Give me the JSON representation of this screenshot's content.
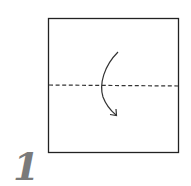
{
  "step": {
    "number": "1"
  },
  "diagram": {
    "paper": {
      "shape": "square",
      "x": 48.5,
      "y": 18.5,
      "width": 130,
      "height": 134,
      "stroke": "#222222",
      "fill": "#ffffff"
    },
    "fold_line": {
      "type": "valley-fold",
      "style": "dashed",
      "x1": 49,
      "y1": 85,
      "x2": 178,
      "y2": 86,
      "stroke": "#333333"
    },
    "arrow": {
      "type": "fold-direction-arrow",
      "direction": "down",
      "stroke": "#333333"
    }
  }
}
